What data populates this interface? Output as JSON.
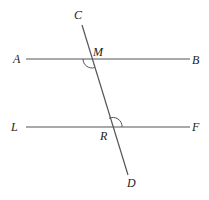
{
  "diagram": {
    "type": "geometry",
    "colors": {
      "line": "#555555",
      "label": "#222222",
      "background": "#ffffff"
    },
    "lines": [
      {
        "name": "AB",
        "x1": 26,
        "y1": 59,
        "x2": 190,
        "y2": 59
      },
      {
        "name": "LF",
        "x1": 26,
        "y1": 127,
        "x2": 190,
        "y2": 127
      },
      {
        "name": "CD",
        "x1": 82,
        "y1": 25,
        "x2": 128,
        "y2": 175
      }
    ],
    "labels": {
      "A": "A",
      "B": "B",
      "C": "C",
      "D": "D",
      "L": "L",
      "F": "F",
      "M": "M",
      "R": "R"
    },
    "angle_marks": [
      {
        "at": "M",
        "position": "below-left",
        "description": "angle AMR"
      },
      {
        "at": "R",
        "position": "above-right",
        "description": "angle MRF"
      }
    ]
  }
}
